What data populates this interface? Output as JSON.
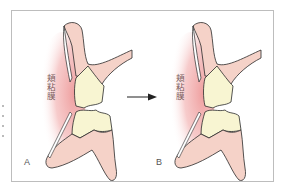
{
  "figure": {
    "panels": [
      {
        "id": "A",
        "label": "A",
        "mucosa_label": "頬粘膜"
      },
      {
        "id": "B",
        "label": "B",
        "mucosa_label": "頬粘膜"
      }
    ],
    "arrow": {
      "direction": "right",
      "from": "A",
      "to": "B"
    },
    "colors": {
      "mucosa_gradient": "#f0a0a0",
      "gingiva_bone": "#f5d2c8",
      "tooth": "#f8f5d2",
      "outline": "#2a2a2a",
      "frame": "#bdbdbd",
      "text": "#7a5a5a"
    }
  }
}
